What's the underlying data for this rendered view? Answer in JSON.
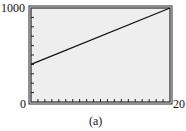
{
  "chart_data": {
    "type": "line",
    "title": "",
    "caption": "(a)",
    "xlabel": "",
    "ylabel": "",
    "xlim": [
      0,
      20
    ],
    "ylim": [
      0,
      1000
    ],
    "x_tick_labels": [
      "0",
      "20"
    ],
    "y_tick_labels": [
      "0",
      "1000"
    ],
    "x_minor_tick_step": 1,
    "y_minor_tick_step": 100,
    "grid": false,
    "series": [
      {
        "name": "line",
        "x": [
          0,
          20
        ],
        "y": [
          400,
          1000
        ]
      }
    ],
    "colors": {
      "plot_bg": "#eeeeee",
      "frame": "#222222",
      "line": "#111111"
    }
  },
  "labels": {
    "y_max": "1000",
    "y_min": "0",
    "x_max": "20",
    "caption": "(a)"
  }
}
